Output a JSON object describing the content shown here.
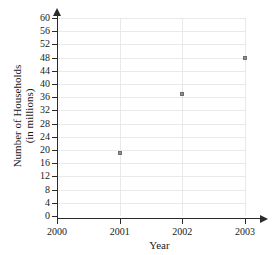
{
  "chart_data": {
    "type": "scatter",
    "title": "",
    "xlabel": "Year",
    "ylabel": "Number of Households (in millions)",
    "ylabel_line1": "Number of Households",
    "ylabel_line2": "(in millions)",
    "x": [
      2001,
      2002,
      2003
    ],
    "values": [
      19,
      37,
      48
    ],
    "points": [
      {
        "x": 2001,
        "y": 19
      },
      {
        "x": 2002,
        "y": 37
      },
      {
        "x": 2003,
        "y": 48
      }
    ],
    "xticks": [
      "2000",
      "2001",
      "2002",
      "2003"
    ],
    "xtick_values": [
      2000,
      2001,
      2002,
      2003
    ],
    "yticks": [
      "0",
      "4",
      "8",
      "12",
      "16",
      "20",
      "24",
      "28",
      "32",
      "36",
      "40",
      "44",
      "48",
      "52",
      "56",
      "60"
    ],
    "ytick_values": [
      0,
      4,
      8,
      12,
      16,
      20,
      24,
      28,
      32,
      36,
      40,
      44,
      48,
      52,
      56,
      60
    ],
    "xlim": [
      2000,
      2003
    ],
    "ylim": [
      0,
      60
    ],
    "grid": true,
    "legend": null,
    "marker_color": "#8e8e8e",
    "grid_color": "#e9e9e9",
    "axis_color": "#2b2b2b",
    "background_color": "#ffffff"
  }
}
